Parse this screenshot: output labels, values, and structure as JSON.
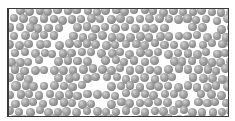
{
  "scene": {
    "description": "Dense random packing of gray spheres inside a rectangular container",
    "frame": {
      "x": 7,
      "y": 8,
      "width": 222,
      "height": 109,
      "border_color": "#3a3a3a"
    },
    "sphere": {
      "diameter": 8.5,
      "color_light": "#d4d4d4",
      "color_mid": "#a8a8a8",
      "color_dark": "#6c6c6c"
    },
    "packing": {
      "approx_count": 420,
      "seed": 17,
      "spacing": 9.6,
      "jitter": 2.6
    }
  }
}
